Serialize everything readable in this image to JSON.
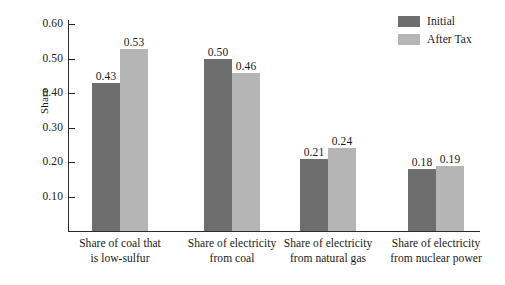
{
  "chart_data": {
    "type": "bar",
    "title": "",
    "xlabel": "",
    "ylabel": "Share",
    "categories": [
      "Share of coal that is low-sulfur",
      "Share of electricity from coal",
      "Share of electricity from natural gas",
      "Share of electricity from nuclear power"
    ],
    "category_lines": [
      [
        "Share of coal that",
        "is low-sulfur"
      ],
      [
        "Share of electricity",
        "from coal"
      ],
      [
        "Share of electricity",
        "from natural gas"
      ],
      [
        "Share of electricity",
        "from nuclear power"
      ]
    ],
    "series": [
      {
        "name": "Initial",
        "color": "#6e6e6e",
        "values": [
          0.43,
          0.5,
          0.21,
          0.18
        ],
        "labels": [
          "0.43",
          "0.50",
          "0.21",
          "0.18"
        ]
      },
      {
        "name": "After Tax",
        "color": "#b5b5b5",
        "values": [
          0.53,
          0.46,
          0.24,
          0.19
        ],
        "labels": [
          "0.53",
          "0.46",
          "0.24",
          "0.19"
        ]
      }
    ],
    "ylim": [
      0,
      0.6
    ],
    "yticks": [
      0.1,
      0.2,
      0.3,
      0.4,
      0.5,
      0.6
    ],
    "ytick_labels": [
      "0.10",
      "0.20",
      "0.30",
      "0.40",
      "0.50",
      "0.60"
    ],
    "grid": false,
    "legend_position": "top-right"
  },
  "legend": {
    "entries": [
      {
        "label": "Initial",
        "color": "#6e6e6e"
      },
      {
        "label": "After Tax",
        "color": "#b5b5b5"
      }
    ]
  }
}
